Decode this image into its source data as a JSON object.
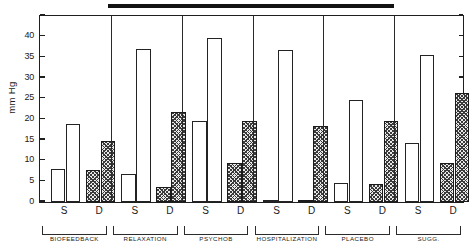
{
  "figure": {
    "ylabel": "mm Hg",
    "title_redacted": true
  },
  "chart_data": {
    "type": "bar",
    "title": "",
    "xlabel": "",
    "ylabel": "mm Hg",
    "ylim": [
      0,
      45
    ],
    "yticks": [
      0,
      5,
      10,
      15,
      20,
      25,
      30,
      35,
      40
    ],
    "ytick_labels": [
      "0",
      "5",
      "10",
      "15",
      "20",
      "25",
      "30",
      "35",
      "40"
    ],
    "grid": false,
    "legend": "none",
    "groups": [
      {
        "name": "BIOFEEDBACK",
        "subgroups": [
          {
            "label": "S",
            "bars": [
              {
                "style": "open",
                "value": 8.0
              },
              {
                "style": "open",
                "value": 18.9
              }
            ]
          },
          {
            "label": "D",
            "bars": [
              {
                "style": "hatched",
                "value": 7.7
              },
              {
                "style": "hatched",
                "value": 14.8
              }
            ]
          }
        ]
      },
      {
        "name": "RELAXATION",
        "subgroups": [
          {
            "label": "S",
            "bars": [
              {
                "style": "open",
                "value": 6.7
              },
              {
                "style": "open",
                "value": 36.9
              }
            ]
          },
          {
            "label": "D",
            "bars": [
              {
                "style": "hatched",
                "value": 3.7
              },
              {
                "style": "hatched",
                "value": 21.7
              }
            ]
          }
        ]
      },
      {
        "name": "PSYCHOB",
        "subgroups": [
          {
            "label": "S",
            "bars": [
              {
                "style": "open",
                "value": 19.7
              },
              {
                "style": "open",
                "value": 39.8
              }
            ]
          },
          {
            "label": "D",
            "bars": [
              {
                "style": "hatched",
                "value": 9.5
              },
              {
                "style": "hatched",
                "value": 19.7
              }
            ]
          }
        ]
      },
      {
        "name": "HOSPITALIZATION",
        "subgroups": [
          {
            "label": "S",
            "bars": [
              {
                "style": "open",
                "value": 0.3
              },
              {
                "style": "open",
                "value": 36.8
              }
            ]
          },
          {
            "label": "D",
            "bars": [
              {
                "style": "hatched",
                "value": 0.3
              },
              {
                "style": "hatched",
                "value": 18.5
              }
            ]
          }
        ]
      },
      {
        "name": "PLACEBO",
        "subgroups": [
          {
            "label": "S",
            "bars": [
              {
                "style": "open",
                "value": 4.5
              },
              {
                "style": "open",
                "value": 24.7
              }
            ]
          },
          {
            "label": "D",
            "bars": [
              {
                "style": "hatched",
                "value": 4.3
              },
              {
                "style": "hatched",
                "value": 19.5
              }
            ]
          }
        ]
      },
      {
        "name": "SUGG.",
        "subgroups": [
          {
            "label": "S",
            "bars": [
              {
                "style": "open",
                "value": 14.3
              },
              {
                "style": "open",
                "value": 35.5
              }
            ]
          },
          {
            "label": "D",
            "bars": [
              {
                "style": "hatched",
                "value": 9.4
              },
              {
                "style": "hatched",
                "value": 26.4
              }
            ]
          }
        ]
      }
    ]
  }
}
